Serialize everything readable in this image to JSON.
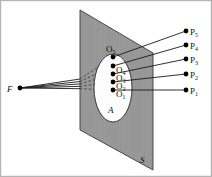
{
  "figure": {
    "colors": {
      "plane_fill": "#9a9a9a",
      "plane_stroke": "#3a3a3a",
      "aperture_fill": "#fdfdfd",
      "aperture_stroke": "#2a2a2a",
      "ray_solid": "#1a1a1a",
      "ray_dashed": "#3a3a3a",
      "dot": "#000000",
      "border": "#b4b4b4",
      "background": "#ffffff",
      "label": "#111111"
    },
    "border_label": ""
  },
  "labels": {
    "focus": {
      "base": "F",
      "sub": ""
    },
    "plane": {
      "base": "S",
      "sub": ""
    },
    "aperture": {
      "base": "A",
      "sub": ""
    },
    "image_points": [
      {
        "base": "O",
        "sub": "1"
      },
      {
        "base": "O",
        "sub": "2"
      },
      {
        "base": "O",
        "sub": "3"
      },
      {
        "base": "O",
        "sub": "4"
      },
      {
        "base": "O",
        "sub": "5"
      }
    ],
    "object_points": [
      {
        "base": "P",
        "sub": "1"
      },
      {
        "base": "P",
        "sub": "2"
      },
      {
        "base": "P",
        "sub": "3"
      },
      {
        "base": "P",
        "sub": "4"
      },
      {
        "base": "P",
        "sub": "5"
      }
    ]
  },
  "geometry": {
    "focus_point": {
      "x": 20,
      "y": 88
    },
    "plane_quad": [
      {
        "x": 80,
        "y": 10
      },
      {
        "x": 153,
        "y": 53
      },
      {
        "x": 153,
        "y": 170
      },
      {
        "x": 80,
        "y": 130
      }
    ],
    "aperture_ellipse": {
      "cx": 113,
      "cy": 88,
      "rx": 19,
      "ry": 34
    },
    "image_point_dots": [
      {
        "x": 113,
        "y": 90
      },
      {
        "x": 113,
        "y": 82
      },
      {
        "x": 113,
        "y": 74
      },
      {
        "x": 113,
        "y": 66
      },
      {
        "x": 113,
        "y": 57
      }
    ],
    "object_point_dots": [
      {
        "x": 186,
        "y": 90
      },
      {
        "x": 186,
        "y": 74
      },
      {
        "x": 186,
        "y": 59
      },
      {
        "x": 186,
        "y": 45
      },
      {
        "x": 186,
        "y": 31
      }
    ],
    "plane_edge_x": 80,
    "dot_radius": 2.4
  }
}
